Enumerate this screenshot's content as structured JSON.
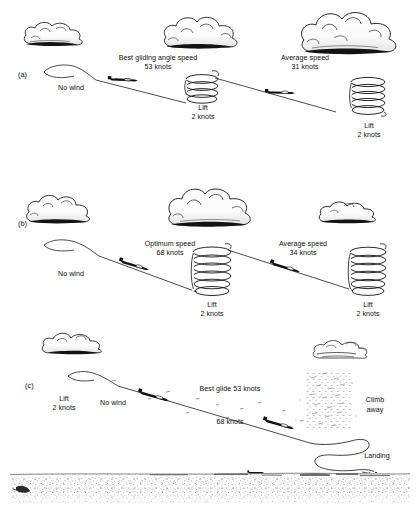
{
  "figure": {
    "type": "technical-diagram",
    "background_color": "#ffffff",
    "ink_color": "#101010",
    "width": 420,
    "height": 515
  },
  "panels": [
    {
      "id": "(a)",
      "id_x": 18,
      "id_y": 70,
      "title": "Best gliding angle speed",
      "labels": [
        {
          "name": "no-wind",
          "text": "No wind",
          "x": 72,
          "y": 84,
          "align": "left"
        },
        {
          "name": "best-gliding-angle-speed",
          "text": "Best gliding angle speed",
          "x": 158,
          "y": 57,
          "align": "center"
        },
        {
          "name": "best-gliding-angle-speed-value",
          "text": "53 knots",
          "x": 158,
          "y": 66,
          "align": "center"
        },
        {
          "name": "lift-left",
          "text": "Lift",
          "x": 203,
          "y": 104,
          "align": "center"
        },
        {
          "name": "lift-left-value",
          "text": "2 knots",
          "x": 203,
          "y": 113,
          "align": "center"
        },
        {
          "name": "average-speed",
          "text": "Average speed",
          "x": 305,
          "y": 57,
          "align": "center"
        },
        {
          "name": "average-speed-value",
          "text": "31 knots",
          "x": 305,
          "y": 66,
          "align": "center"
        },
        {
          "name": "lift-right",
          "text": "Lift",
          "x": 369,
          "y": 122,
          "align": "center"
        },
        {
          "name": "lift-right-value",
          "text": "2 knots",
          "x": 369,
          "y": 131,
          "align": "center"
        }
      ]
    },
    {
      "id": "(b)",
      "id_x": 18,
      "id_y": 219,
      "title": "Optimum speed",
      "labels": [
        {
          "name": "no-wind",
          "text": "No wind",
          "x": 72,
          "y": 270,
          "align": "left"
        },
        {
          "name": "optimum-speed",
          "text": "Optimum speed",
          "x": 170,
          "y": 242,
          "align": "center"
        },
        {
          "name": "optimum-speed-value",
          "text": "68 knots",
          "x": 170,
          "y": 251,
          "align": "center"
        },
        {
          "name": "lift-left",
          "text": "Lift",
          "x": 212,
          "y": 301,
          "align": "center"
        },
        {
          "name": "lift-left-value",
          "text": "2 knots",
          "x": 212,
          "y": 310,
          "align": "center"
        },
        {
          "name": "average-speed",
          "text": "Average speed",
          "x": 303,
          "y": 242,
          "align": "center"
        },
        {
          "name": "average-speed-value",
          "text": "34 knots",
          "x": 303,
          "y": 251,
          "align": "center"
        },
        {
          "name": "lift-right",
          "text": "Lift",
          "x": 368,
          "y": 301,
          "align": "center"
        },
        {
          "name": "lift-right-value",
          "text": "2 knots",
          "x": 368,
          "y": 310,
          "align": "center"
        }
      ]
    },
    {
      "id": "(c)",
      "id_x": 25,
      "id_y": 381,
      "title": "Final glide and landing",
      "labels": [
        {
          "name": "lift",
          "text": "Lift",
          "x": 64,
          "y": 397,
          "align": "center"
        },
        {
          "name": "lift-value",
          "text": "2 knots",
          "x": 64,
          "y": 406,
          "align": "center"
        },
        {
          "name": "no-wind",
          "text": "No wind",
          "x": 113,
          "y": 401,
          "align": "center"
        },
        {
          "name": "best-glide",
          "text": "Best glide 53 knots",
          "x": 230,
          "y": 388,
          "align": "center"
        },
        {
          "name": "second-speed",
          "text": "68 knots",
          "x": 230,
          "y": 421,
          "align": "center"
        },
        {
          "name": "climb-away",
          "text": "Climb",
          "x": 374,
          "y": 399,
          "align": "center"
        },
        {
          "name": "climb-away-2",
          "text": "away",
          "x": 374,
          "y": 409,
          "align": "center"
        },
        {
          "name": "landing",
          "text": "Landing",
          "x": 377,
          "y": 455,
          "align": "center"
        }
      ]
    }
  ],
  "measurements": {
    "best_gliding_angle_speed_knots": 53,
    "optimum_speed_knots": 68,
    "average_speed_a_knots": 31,
    "average_speed_b_knots": 34,
    "lift_knots": 2,
    "wind": "No wind"
  }
}
